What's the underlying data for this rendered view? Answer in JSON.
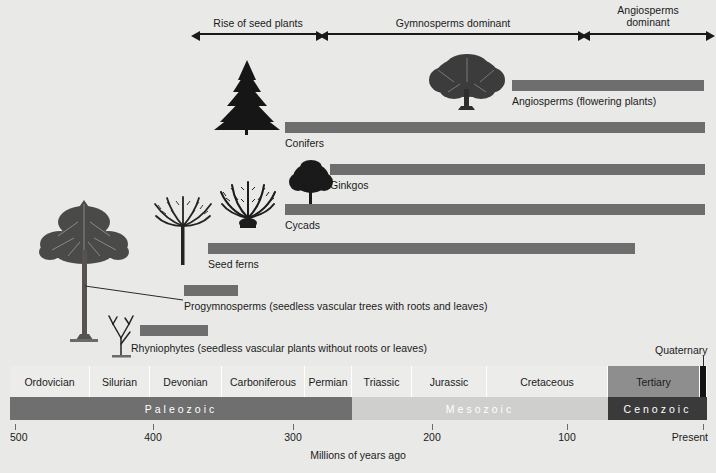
{
  "figure": {
    "axis_title": "Millions of years ago",
    "axis_ticks": [
      {
        "label": "500",
        "value": 500,
        "x": 15
      },
      {
        "label": "400",
        "value": 400,
        "x": 153
      },
      {
        "label": "300",
        "value": 300,
        "x": 293
      },
      {
        "label": "200",
        "value": 200,
        "x": 432
      },
      {
        "label": "100",
        "value": 100,
        "x": 567
      },
      {
        "label": "Present",
        "value": 0,
        "x": 703
      }
    ]
  },
  "era_arrows": [
    {
      "label": "Rise of seed plants",
      "x1": 200,
      "x2": 316,
      "name": "arrow-rise-of-seed-plants"
    },
    {
      "label": "Gymnosperms dominant",
      "x1": 328,
      "x2": 578,
      "name": "arrow-gymnosperms-dominant"
    },
    {
      "label": "Angiosperms\ndominant",
      "x1": 590,
      "x2": 706,
      "name": "arrow-angiosperms-dominant"
    }
  ],
  "groups": [
    {
      "name": "angiosperms",
      "label": "Angiosperms (flowering plants)",
      "bar_x1": 512,
      "bar_x2": 704,
      "bar_y": 80,
      "label_x": 512,
      "label_y": 95
    },
    {
      "name": "conifers",
      "label": "Conifers",
      "bar_x1": 285,
      "bar_x2": 705,
      "bar_y": 122,
      "label_x": 285,
      "label_y": 137
    },
    {
      "name": "ginkgos",
      "label": "Ginkgos",
      "bar_x1": 330,
      "bar_x2": 705,
      "bar_y": 164,
      "label_x": 330,
      "label_y": 179
    },
    {
      "name": "cycads",
      "label": "Cycads",
      "bar_x1": 285,
      "bar_x2": 705,
      "bar_y": 204,
      "label_x": 285,
      "label_y": 219
    },
    {
      "name": "seed-ferns",
      "label": "Seed ferns",
      "bar_x1": 208,
      "bar_x2": 635,
      "bar_y": 243,
      "label_x": 208,
      "label_y": 258
    },
    {
      "name": "progymnosperms",
      "label": "Progymnosperms (seedless vascular trees with roots and leaves)",
      "bar_x1": 184,
      "bar_x2": 238,
      "bar_y": 285,
      "label_x": 184,
      "label_y": 300
    },
    {
      "name": "rhyniophytes",
      "label": "Rhyniophytes (seedless vascular plants without roots or leaves)",
      "bar_x1": 140,
      "bar_x2": 208,
      "bar_y": 325,
      "label_x": 131,
      "label_y": 342
    }
  ],
  "timescale": {
    "quaternary_label": "Quaternary",
    "periods": [
      {
        "label": "Ordovician",
        "x1": 10,
        "x2": 90,
        "style": "light"
      },
      {
        "label": "Silurian",
        "x1": 90,
        "x2": 150,
        "style": "light"
      },
      {
        "label": "Devonian",
        "x1": 150,
        "x2": 222,
        "style": "light"
      },
      {
        "label": "Carboniferous",
        "x1": 222,
        "x2": 305,
        "style": "light"
      },
      {
        "label": "Permian",
        "x1": 305,
        "x2": 352,
        "style": "light"
      },
      {
        "label": "Triassic",
        "x1": 352,
        "x2": 412,
        "style": "light"
      },
      {
        "label": "Jurassic",
        "x1": 412,
        "x2": 487,
        "style": "light"
      },
      {
        "label": "Cretaceous",
        "x1": 487,
        "x2": 608,
        "style": "light"
      },
      {
        "label": "Tertiary",
        "x1": 608,
        "x2": 700,
        "style": "dark"
      },
      {
        "label": "",
        "x1": 700,
        "x2": 707,
        "style": "black"
      }
    ],
    "eras": [
      {
        "label": "Paleozoic",
        "x1": 10,
        "x2": 352,
        "color": "#6f6f6f",
        "text": "#ffffff"
      },
      {
        "label": "Mesozoic",
        "x1": 352,
        "x2": 608,
        "color": "#cfcfcd",
        "text": "#ffffff"
      },
      {
        "label": "Cenozoic",
        "x1": 608,
        "x2": 707,
        "color": "#3a3a3a",
        "text": "#ffffff"
      }
    ]
  },
  "colors": {
    "background": "#e9e9e7",
    "bar": "#6e6e6e",
    "ink": "#1b1b1b"
  }
}
